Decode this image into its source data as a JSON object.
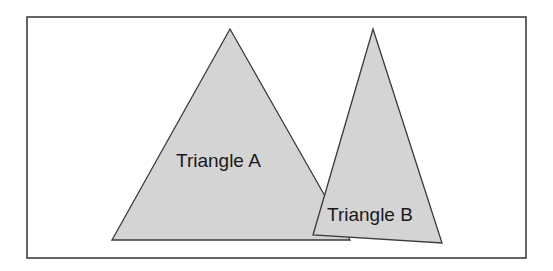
{
  "diagram": {
    "frame": {
      "x": 27,
      "y": 17,
      "width": 499,
      "height": 241,
      "stroke": "#333333"
    },
    "fill_color": "#d4d4d4",
    "stroke_color": "#3a3a3a",
    "triangles": [
      {
        "name": "Triangle A",
        "label": "Triangle A",
        "points": "230,29 350,240 112,240",
        "label_x": 176,
        "label_y": 167
      },
      {
        "name": "Triangle B",
        "label": "Triangle B",
        "points": "373,29 442,243 313,235",
        "label_x": 327,
        "label_y": 221
      }
    ]
  }
}
